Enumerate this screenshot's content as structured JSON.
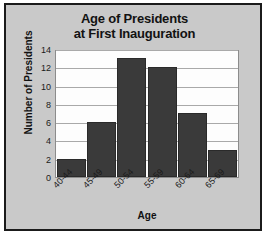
{
  "chart_data": {
    "type": "bar",
    "title": "Age of Presidents at First Inauguration",
    "title_lines": [
      "Age of Presidents",
      "at First Inauguration"
    ],
    "categories": [
      "40-44",
      "45-49",
      "50-54",
      "55-59",
      "60-64",
      "65-69"
    ],
    "values": [
      2,
      6,
      13,
      12,
      7,
      3
    ],
    "xlabel": "Age",
    "ylabel": "Number of Presidents",
    "ylim": [
      0,
      14
    ],
    "ytick_labels": [
      "14",
      "12",
      "10",
      "8",
      "6",
      "4",
      "2",
      "0"
    ],
    "ytick_values": [
      14,
      12,
      10,
      8,
      6,
      4,
      2,
      0
    ],
    "grid": true,
    "legend": false,
    "colors": {
      "bar": "#3a3a3a",
      "plot_background": "#fdfdfd",
      "figure_background": "#c9c9c9",
      "gridline": "#a9a9a9",
      "border": "#1b1b1b",
      "text": "#121212"
    }
  }
}
